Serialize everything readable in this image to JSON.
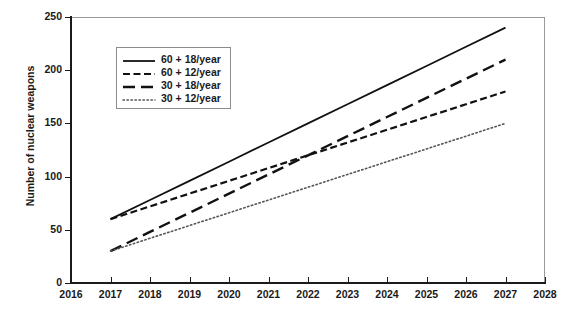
{
  "chart_data": {
    "type": "line",
    "title": "",
    "xlabel": "",
    "ylabel": "Number of nuclear weapons",
    "xlim": [
      2016,
      2028
    ],
    "ylim": [
      0,
      250
    ],
    "xticks": [
      2016,
      2017,
      2018,
      2019,
      2020,
      2021,
      2022,
      2023,
      2024,
      2025,
      2026,
      2027,
      2028
    ],
    "yticks": [
      0,
      50,
      100,
      150,
      200,
      250
    ],
    "grid": false,
    "legend_position": "upper left",
    "x": [
      2017,
      2018,
      2019,
      2020,
      2021,
      2022,
      2023,
      2024,
      2025,
      2026,
      2027
    ],
    "series": [
      {
        "name": "60 + 18/year",
        "style": "solid",
        "color": "#111111",
        "values": [
          60,
          78,
          96,
          114,
          132,
          150,
          168,
          186,
          204,
          222,
          240
        ]
      },
      {
        "name": "60 + 12/year",
        "style": "short-dash",
        "color": "#111111",
        "values": [
          60,
          72,
          84,
          96,
          108,
          120,
          132,
          144,
          156,
          168,
          180
        ]
      },
      {
        "name": "30 + 18/year",
        "style": "long-dash",
        "color": "#111111",
        "values": [
          30,
          48,
          66,
          84,
          102,
          120,
          138,
          156,
          174,
          192,
          210
        ]
      },
      {
        "name": "30 + 12/year",
        "style": "dotted",
        "color": "#555555",
        "values": [
          30,
          42,
          54,
          66,
          78,
          90,
          102,
          114,
          126,
          138,
          150
        ]
      }
    ]
  },
  "axes": {
    "ytick_labels": [
      "0",
      "50",
      "100",
      "150",
      "200",
      "250"
    ],
    "xtick_labels": [
      "2016",
      "2017",
      "2018",
      "2019",
      "2020",
      "2021",
      "2022",
      "2023",
      "2024",
      "2025",
      "2026",
      "2027",
      "2028"
    ],
    "ylabel": "Number of nuclear weapons"
  },
  "legend": {
    "items": [
      {
        "label": "60 + 18/year"
      },
      {
        "label": "60 + 12/year"
      },
      {
        "label": "30 + 18/year"
      },
      {
        "label": "30 + 12/year"
      }
    ]
  }
}
